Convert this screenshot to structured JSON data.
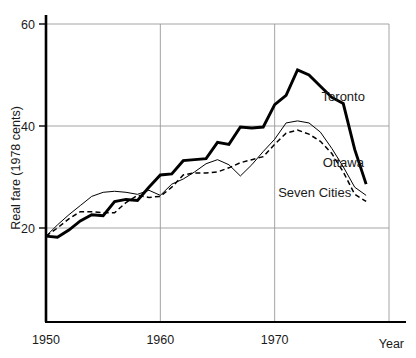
{
  "chart_data": {
    "type": "line",
    "title": "",
    "xlabel": "Year",
    "ylabel": "Real fare (1978 cents)",
    "xlim": [
      1950,
      1980
    ],
    "ylim": [
      10,
      62
    ],
    "grid": true,
    "legend_position": "inline-right",
    "xticks": [
      "1950",
      "1960",
      "1970"
    ],
    "yticks": [
      "20",
      "40",
      "60"
    ],
    "x": [
      1950,
      1951,
      1952,
      1953,
      1954,
      1955,
      1956,
      1957,
      1958,
      1959,
      1960,
      1961,
      1962,
      1963,
      1964,
      1965,
      1966,
      1967,
      1968,
      1969,
      1970,
      1971,
      1972,
      1973,
      1974,
      1975,
      1976,
      1977,
      1978
    ],
    "series": [
      {
        "name": "Toronto",
        "style": "thick-solid",
        "values": [
          18.4,
          18.2,
          19.6,
          21.4,
          22.6,
          22.4,
          25.2,
          25.6,
          25.4,
          28.0,
          30.4,
          30.6,
          33.2,
          33.4,
          33.6,
          36.8,
          36.4,
          39.8,
          39.6,
          39.8,
          44.2,
          46.0,
          51.0,
          50.0,
          47.8,
          45.6,
          44.4,
          35.4,
          28.6
        ]
      },
      {
        "name": "Ottawa",
        "style": "thin-solid",
        "values": [
          18.4,
          20.6,
          22.6,
          24.4,
          26.2,
          27.0,
          27.2,
          27.0,
          26.6,
          27.4,
          26.4,
          28.6,
          29.6,
          31.0,
          32.6,
          33.4,
          32.4,
          30.2,
          32.4,
          35.0,
          37.4,
          40.6,
          41.0,
          40.6,
          38.8,
          35.6,
          32.0,
          28.0,
          26.4
        ]
      },
      {
        "name": "Seven Cities",
        "style": "dashed",
        "values": [
          18.4,
          20.0,
          21.8,
          23.2,
          23.2,
          23.0,
          23.0,
          25.0,
          26.4,
          26.0,
          26.2,
          28.0,
          30.4,
          30.8,
          30.8,
          31.0,
          31.8,
          32.8,
          33.4,
          34.0,
          36.4,
          38.6,
          39.2,
          38.4,
          37.0,
          34.6,
          31.0,
          26.6,
          25.2
        ]
      }
    ],
    "annotations": [
      {
        "text": "Toronto",
        "x": 1976.0,
        "y": 45.0
      },
      {
        "text": "Ottawa",
        "x": 1976.0,
        "y": 32.0
      },
      {
        "text": "Seven Cities",
        "x": 1973.5,
        "y": 26.0
      }
    ],
    "colors": {
      "line": "#000000",
      "grid": "#9a9a9a",
      "axis": "#000000",
      "background": "#ffffff"
    }
  }
}
